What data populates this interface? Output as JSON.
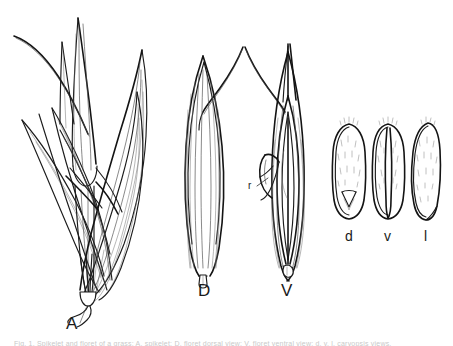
{
  "plate": {
    "background_color": "#ffffff",
    "ink_color": "#1a1a1a",
    "width": 453,
    "height": 346,
    "caption_fragment": "Fig. 1. Spikelet and floret of a grass: A, spikelet; D, floret dorsal view; V, floret ventral view; d, v, l, caryopsis views."
  },
  "panels": [
    {
      "id": "A",
      "label": "A",
      "name": "spikelet-cluster",
      "description": "Whole spikelet with several spreading lemmas and glumes, awned tips and a bearded callus at the base"
    },
    {
      "id": "D",
      "label": "D",
      "name": "floret-dorsal-view",
      "description": "Single floret, dorsal (lemma) face, long curved awn, square callus at base"
    },
    {
      "id": "V",
      "label": "V",
      "name": "floret-ventral-view",
      "description": "Single floret, ventral (palea) face, long curved awn, rachilla visible"
    }
  ],
  "annotations": [
    {
      "id": "r",
      "label": "r",
      "name": "rachilla",
      "panel": "V",
      "description": "Leader line pointing to the rachilla appendage"
    }
  ],
  "caryopsis_views": [
    {
      "id": "d",
      "label": "d",
      "name": "caryopsis-dorsal",
      "description": "Dorsal view, oval, hilum notch at base, pubescent"
    },
    {
      "id": "v",
      "label": "v",
      "name": "caryopsis-ventral",
      "description": "Ventral view with median longitudinal groove"
    },
    {
      "id": "l",
      "label": "l",
      "name": "caryopsis-lateral",
      "description": "Lateral view, asymmetric crescent outline"
    }
  ]
}
